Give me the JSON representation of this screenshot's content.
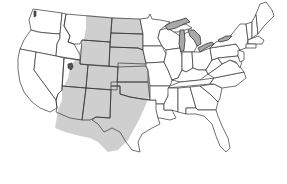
{
  "map": {
    "title": "",
    "subject": "Contiguous United States outline map with shaded region",
    "colors": {
      "background": "#ffffff",
      "state_fill": "#ffffff",
      "state_border": "#333333",
      "shaded_region": "#cfcfcf",
      "great_lakes": "#a9a9a9",
      "great_salt_lake": "#555555"
    },
    "shaded_region": {
      "label": "",
      "description": "Light gray region covering the Great Plains / Rocky Mountain corridor",
      "states_covered": [
        "Montana (east)",
        "Wyoming",
        "North Dakota",
        "South Dakota",
        "Nebraska",
        "Colorado",
        "Kansas",
        "Utah (east)",
        "Arizona",
        "New Mexico",
        "Oklahoma (west)",
        "Texas (west)"
      ]
    },
    "water_features": [
      "Lake Superior",
      "Lake Michigan",
      "Lake Huron",
      "Lake Erie",
      "Lake Ontario",
      "Great Salt Lake"
    ]
  }
}
